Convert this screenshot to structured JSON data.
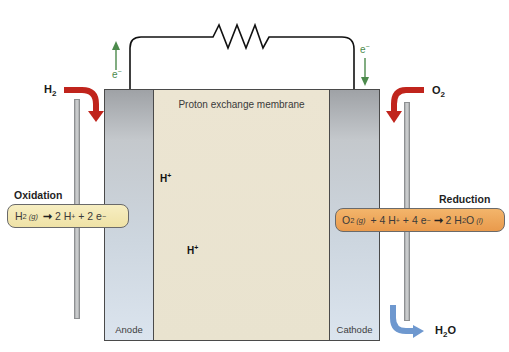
{
  "diagram": {
    "membrane_label": "Proton exchange membrane",
    "anode_label": "Anode",
    "cathode_label": "Cathode",
    "inputs": {
      "left_gas": "H",
      "left_gas_sub": "2",
      "right_gas": "O",
      "right_gas_sub": "2",
      "output": "H",
      "output_sub": "2",
      "output_tail": "O"
    },
    "electron_flow": {
      "left": {
        "label": "e",
        "charge": "−",
        "direction": "up"
      },
      "right": {
        "label": "e",
        "charge": "−",
        "direction": "down"
      }
    },
    "proton_flow": [
      {
        "label": "H",
        "charge": "+",
        "direction": "right"
      },
      {
        "label": "H",
        "charge": "+",
        "direction": "right"
      }
    ],
    "oxidation": {
      "title": "Oxidation",
      "reactant": "H",
      "reactant_sub": "2",
      "reactant_state": "(g)",
      "arrow": "➞",
      "products_a": "2 H",
      "products_a_sup": "+",
      "products_b": " + 2 e",
      "products_b_sup": "−"
    },
    "reduction": {
      "title": "Reduction",
      "r1": "O",
      "r1_sub": "2",
      "r1_state": "(g)",
      "r2": " + 4 H",
      "r2_sup": "+",
      "r3": " + 4 e",
      "r3_sup": "−",
      "arrow": "➞",
      "p1": "2 H",
      "p1_sub": "2",
      "p1_tail": "O",
      "p1_state": "(l)"
    },
    "colors": {
      "gas_arrow": "#c0241c",
      "water_arrow": "#6e98cf",
      "electron_arrow": "#4c8a4c",
      "oxidation_box": "#f2e6b0",
      "reduction_box": "#ec a452"
    }
  }
}
